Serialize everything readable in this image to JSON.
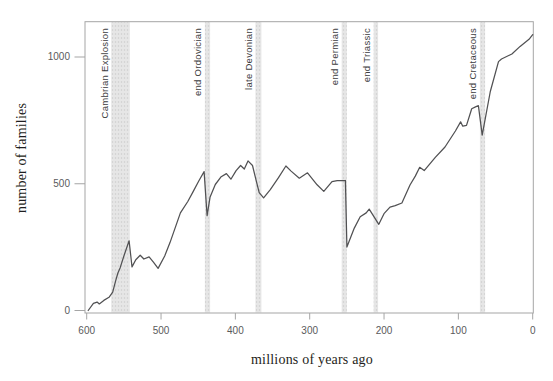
{
  "chart_data": {
    "type": "line",
    "title": "",
    "xlabel": "millions of years ago",
    "ylabel": "number of families",
    "x_axis": {
      "min": 0,
      "max": 600,
      "reversed": true,
      "ticks": [
        600,
        500,
        400,
        300,
        200,
        100,
        0
      ]
    },
    "y_axis": {
      "min": 0,
      "max": 1140,
      "ticks": [
        0,
        500,
        1000
      ]
    },
    "grid": "off",
    "legend": "none",
    "extinction_events": [
      {
        "label": "Cambrian Explosion",
        "start": 567,
        "end": 542
      },
      {
        "label": "end Ordovician",
        "start": 441,
        "end": 434
      },
      {
        "label": "late Devonian",
        "start": 373,
        "end": 365
      },
      {
        "label": "end Permian",
        "start": 257,
        "end": 250
      },
      {
        "label": "end Triassic",
        "start": 214,
        "end": 208
      },
      {
        "label": "end Cretaceous",
        "start": 71,
        "end": 64
      }
    ],
    "series": [
      {
        "name": "number of families",
        "x_unit": "millions of years ago",
        "points": [
          [
            598,
            0
          ],
          [
            591,
            28
          ],
          [
            586,
            33
          ],
          [
            583,
            26
          ],
          [
            577,
            40
          ],
          [
            570,
            52
          ],
          [
            565,
            72
          ],
          [
            561,
            118
          ],
          [
            558,
            148
          ],
          [
            555,
            168
          ],
          [
            550,
            215
          ],
          [
            543,
            275
          ],
          [
            539,
            172
          ],
          [
            534,
            200
          ],
          [
            528,
            218
          ],
          [
            523,
            203
          ],
          [
            516,
            212
          ],
          [
            510,
            190
          ],
          [
            504,
            166
          ],
          [
            495,
            215
          ],
          [
            488,
            268
          ],
          [
            474,
            385
          ],
          [
            464,
            430
          ],
          [
            457,
            468
          ],
          [
            449,
            512
          ],
          [
            442,
            548
          ],
          [
            438,
            374
          ],
          [
            434,
            448
          ],
          [
            427,
            497
          ],
          [
            419,
            528
          ],
          [
            412,
            540
          ],
          [
            406,
            518
          ],
          [
            399,
            552
          ],
          [
            393,
            572
          ],
          [
            388,
            558
          ],
          [
            383,
            590
          ],
          [
            377,
            572
          ],
          [
            372,
            512
          ],
          [
            368,
            465
          ],
          [
            362,
            444
          ],
          [
            353,
            477
          ],
          [
            342,
            524
          ],
          [
            332,
            570
          ],
          [
            325,
            550
          ],
          [
            314,
            522
          ],
          [
            303,
            543
          ],
          [
            290,
            496
          ],
          [
            281,
            470
          ],
          [
            270,
            508
          ],
          [
            263,
            512
          ],
          [
            252,
            513
          ],
          [
            250,
            250
          ],
          [
            240,
            325
          ],
          [
            232,
            370
          ],
          [
            224,
            385
          ],
          [
            220,
            400
          ],
          [
            207,
            340
          ],
          [
            200,
            382
          ],
          [
            192,
            408
          ],
          [
            185,
            414
          ],
          [
            176,
            424
          ],
          [
            165,
            495
          ],
          [
            158,
            530
          ],
          [
            152,
            565
          ],
          [
            146,
            552
          ],
          [
            131,
            604
          ],
          [
            118,
            645
          ],
          [
            104,
            708
          ],
          [
            97,
            744
          ],
          [
            94,
            727
          ],
          [
            89,
            730
          ],
          [
            82,
            796
          ],
          [
            77,
            803
          ],
          [
            73,
            808
          ],
          [
            68,
            692
          ],
          [
            57,
            864
          ],
          [
            46,
            982
          ],
          [
            42,
            992
          ],
          [
            28,
            1012
          ],
          [
            17,
            1042
          ],
          [
            5,
            1070
          ],
          [
            0,
            1088
          ]
        ]
      }
    ],
    "colors": {
      "background": "#ffffff",
      "line": "#515153",
      "axis": "#a5a5a5",
      "band_fill": "#e6e6e6",
      "band_dot": "#cccccc",
      "tick_label": "#5a5a5c",
      "event_label": "#3c3c3e",
      "axis_title": "#1e1e20"
    }
  }
}
